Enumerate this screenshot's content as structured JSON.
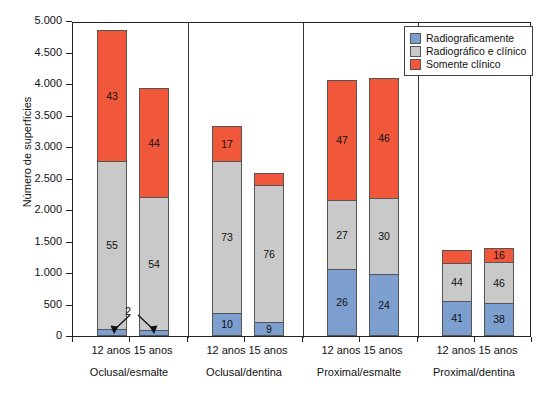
{
  "chart_data": {
    "type": "bar",
    "subtype": "stacked-bar",
    "title": "",
    "xlabel": "",
    "ylabel": "Número de superfícies",
    "ylim": [
      0,
      5000
    ],
    "ytick_labels": [
      "5.000",
      "4.500",
      "4.000",
      "3.500",
      "3.000",
      "2.500",
      "2.000",
      "1.500",
      "1.000",
      "500",
      "0"
    ],
    "ytick_values": [
      5000,
      4500,
      4000,
      3500,
      3000,
      2500,
      2000,
      1500,
      1000,
      500,
      0
    ],
    "grid": false,
    "legend_position": "top-right",
    "legend": [
      "Radiograficamente",
      "Radiográfico e clínico",
      "Somente clínico"
    ],
    "series": [
      {
        "name": "Radiograficamente",
        "color": "#7d9fd0",
        "values": [
          110,
          100,
          360,
          220,
          1070,
          980,
          560,
          530
        ]
      },
      {
        "name": "Radiográfico e clínico",
        "color": "#c9c9c9",
        "values": [
          2670,
          2100,
          2420,
          2170,
          1090,
          1210,
          600,
          640
        ]
      },
      {
        "name": "Somente clínico",
        "color": "#f1573a",
        "values": [
          2070,
          1730,
          550,
          200,
          1900,
          1910,
          205,
          225
        ]
      }
    ],
    "data_labels": [
      {
        "group": "Oclusal/esmalte",
        "age": "12 anos",
        "blue": "2",
        "gray": "55",
        "red": "43",
        "total": 4850
      },
      {
        "group": "Oclusal/esmalte",
        "age": "15 anos",
        "blue": "2",
        "gray": "54",
        "red": "44",
        "total": 3930
      },
      {
        "group": "Oclusal/dentina",
        "age": "12 anos",
        "blue": "10",
        "gray": "73",
        "red": "17",
        "total": 3330
      },
      {
        "group": "Oclusal/dentina",
        "age": "15 anos",
        "blue": "9",
        "gray": "76",
        "red": "16",
        "total": 2590
      },
      {
        "group": "Proximal/esmalte",
        "age": "12 anos",
        "blue": "26",
        "gray": "27",
        "red": "47",
        "total": 4060
      },
      {
        "group": "Proximal/esmalte",
        "age": "15 anos",
        "blue": "24",
        "gray": "30",
        "red": "46",
        "total": 4100
      },
      {
        "group": "Proximal/dentina",
        "age": "12 anos",
        "blue": "41",
        "gray": "44",
        "red": "15",
        "total": 1365
      },
      {
        "group": "Proximal/dentina",
        "age": "15 anos",
        "blue": "38",
        "gray": "46",
        "red": "16",
        "total": 1395
      }
    ],
    "categories": [
      "Oclusal/esmalte 12 anos",
      "Oclusal/esmalte 15 anos",
      "Oclusal/dentina 12 anos",
      "Oclusal/dentina 15 anos",
      "Proximal/esmalte 12 anos",
      "Proximal/esmalte 15 anos",
      "Proximal/dentina 12 anos",
      "Proximal/dentina 15 anos"
    ],
    "annotations": [
      {
        "text": "2",
        "note": "callout with two arrows pointing to the small blue segments of the two Oclusal/esmalte bars"
      }
    ]
  },
  "axis": {
    "y_title": "Número de superfícies",
    "ticks": [
      {
        "label": "5.000",
        "value": 5000
      },
      {
        "label": "4.500",
        "value": 4500
      },
      {
        "label": "4.000",
        "value": 4000
      },
      {
        "label": "3.500",
        "value": 3500
      },
      {
        "label": "3.000",
        "value": 3000
      },
      {
        "label": "2.500",
        "value": 2500
      },
      {
        "label": "2.000",
        "value": 2000
      },
      {
        "label": "1.500",
        "value": 1500
      },
      {
        "label": "1.000",
        "value": 1000
      },
      {
        "label": "500",
        "value": 500
      },
      {
        "label": "0",
        "value": 0
      }
    ]
  },
  "groups": [
    {
      "label": "Oclusal/esmalte",
      "ages": [
        "12 anos",
        "15 anos"
      ]
    },
    {
      "label": "Oclusal/dentina",
      "ages": [
        "12 anos",
        "15 anos"
      ]
    },
    {
      "label": "Proximal/esmalte",
      "ages": [
        "12 anos",
        "15 anos"
      ]
    },
    {
      "label": "Proximal/dentina",
      "ages": [
        "12 anos",
        "15 anos"
      ]
    }
  ],
  "legend": {
    "items": [
      {
        "label": "Radiograficamente",
        "color": "#7d9fd0",
        "swatch": "blue"
      },
      {
        "label": "Radiográfico e clínico",
        "color": "#c9c9c9",
        "swatch": "gray"
      },
      {
        "label": "Somente clínico",
        "color": "#f1573a",
        "swatch": "red"
      }
    ]
  },
  "annotation": {
    "label": "2"
  },
  "colors": {
    "blue": "#7d9fd0",
    "gray": "#c9c9c9",
    "red": "#f1573a",
    "axis": "#222222",
    "background": "#ffffff"
  }
}
